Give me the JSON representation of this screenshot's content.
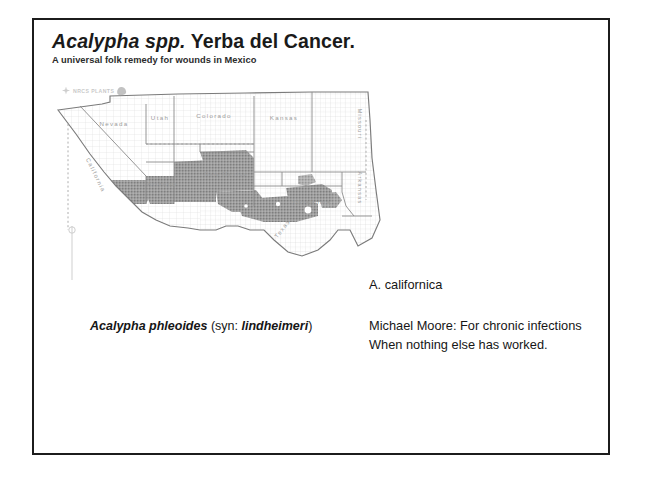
{
  "slide": {
    "title_scientific": "Acalypha spp.",
    "title_common": " Yerba del Cancer.",
    "subtitle": "A universal folk remedy for wounds in Mexico"
  },
  "map": {
    "watermark_text": "NRCS PLANTS",
    "watermark_mark_icon": "flower-icon",
    "watermark_leaf_icon": "leaf-icon",
    "state_labels": [
      "Nevada",
      "Utah",
      "Colorado",
      "Kansas",
      "California",
      "Arizona",
      "New Mexico",
      "Oklahoma",
      "Texas",
      "Missouri",
      "Arkansas",
      "Louisiana"
    ],
    "shading_color": "#9a9a9a",
    "outline_color": "#8a8a8a"
  },
  "captions": {
    "phleoides_name": "Acalypha phleoides",
    "phleoides_syn_lead": " (syn: ",
    "phleoides_syn_name": "lindheimeri",
    "phleoides_syn_close": ")",
    "californica": "A. californica",
    "note_line1": "Michael Moore: For chronic infections",
    "note_line2": "When nothing else has worked."
  }
}
